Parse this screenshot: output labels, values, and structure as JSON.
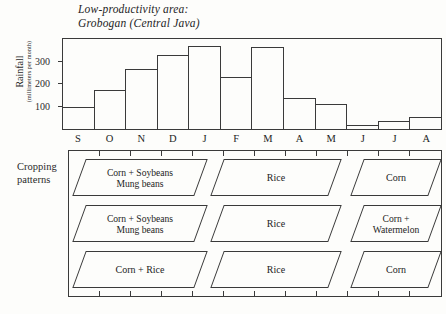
{
  "title": "Low-productivity area:\nGrobogan (Central Java)",
  "chart_data": {
    "type": "bar",
    "title": "Low-productivity area: Grobogan (Central Java)",
    "xlabel": "",
    "ylabel": "Rainfall",
    "ylabel_sub": "(millimeters per month)",
    "categories": [
      "S",
      "O",
      "N",
      "D",
      "J",
      "F",
      "M",
      "A",
      "M",
      "J",
      "J",
      "A"
    ],
    "values": [
      100,
      175,
      265,
      330,
      370,
      230,
      365,
      140,
      110,
      20,
      35,
      55
    ],
    "ylim": [
      0,
      400
    ],
    "yticks": [
      100,
      200,
      300
    ],
    "ytick_labels": [
      "100",
      "200",
      "300"
    ],
    "grid": false,
    "legend": null
  },
  "cropping": {
    "label": "Cropping\npatterns",
    "rows": [
      {
        "cells": [
          {
            "text": "Corn  +  Soybeans\nMung beans",
            "two_line": true
          },
          {
            "text": "Rice",
            "two_line": false
          },
          {
            "text": "Corn",
            "two_line": false
          }
        ]
      },
      {
        "cells": [
          {
            "text": "Corn  +  Soybeans\nMung beans",
            "two_line": true
          },
          {
            "text": "Rice",
            "two_line": false
          },
          {
            "text": "Corn  +\nWatermelon",
            "two_line": true
          }
        ]
      },
      {
        "cells": [
          {
            "text": "Corn +  Rice",
            "two_line": false
          },
          {
            "text": "Rice",
            "two_line": false
          },
          {
            "text": "Corn",
            "two_line": false
          }
        ]
      }
    ]
  },
  "colors": {
    "ink": "#3a3a3a",
    "text": "#242424",
    "background": "#fdfdfb"
  }
}
